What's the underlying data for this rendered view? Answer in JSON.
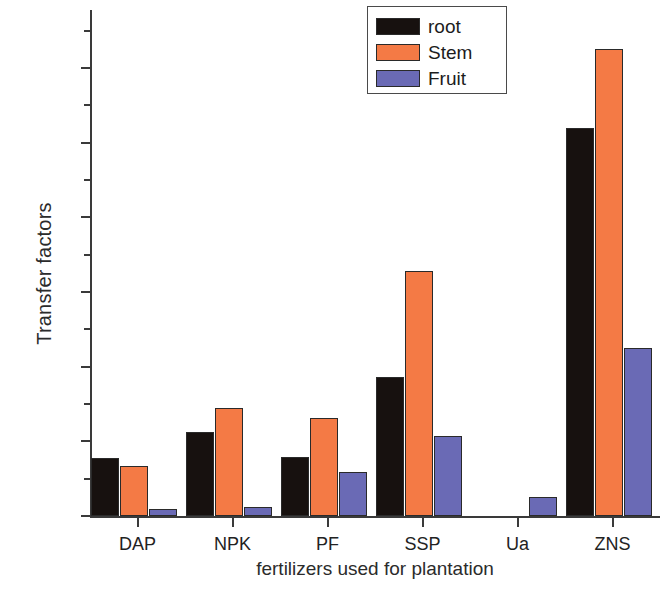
{
  "chart_data": {
    "type": "bar",
    "title": "",
    "xlabel": "fertilizers used for plantation",
    "ylabel": "Transfer factors",
    "categories": [
      "DAP",
      "NPK",
      "PF",
      "SSP",
      "Ua",
      "ZNS"
    ],
    "series": [
      {
        "name": "root",
        "color": "#17110f",
        "values": [
          0.0155,
          0.0225,
          0.0158,
          0.0373,
          0.0,
          0.104
        ]
      },
      {
        "name": "Stem",
        "color": "#f47a45",
        "values": [
          0.0133,
          0.0288,
          0.0263,
          0.0655,
          0.0,
          0.125
        ]
      },
      {
        "name": "Fruit",
        "color": "#6a6ab5",
        "values": [
          0.002,
          0.0025,
          0.0118,
          0.0213,
          0.005,
          0.045
        ]
      }
    ],
    "ylim": [
      0.0,
      0.1355
    ],
    "ytick_labels": [
      "0.00",
      "0.02",
      "0.04",
      "0.06",
      "0.08",
      "0.10",
      "0.12"
    ],
    "ytick_values": [
      0.0,
      0.02,
      0.04,
      0.06,
      0.08,
      0.1,
      0.12
    ],
    "yminor_values": [
      0.01,
      0.03,
      0.05,
      0.07,
      0.09,
      0.11,
      0.13
    ],
    "grid": false,
    "legend_position": "top-right",
    "legend_entries": [
      "root",
      "Stem",
      "Fruit"
    ]
  }
}
